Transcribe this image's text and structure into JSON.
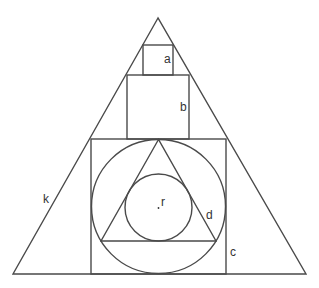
{
  "diagram": {
    "labels": {
      "a": "a",
      "b": "b",
      "c": "c",
      "d": "d",
      "k": "k",
      "r": "r"
    },
    "colors": {
      "line": "#4a4a4a",
      "text": "#333333",
      "background": "#ffffff"
    }
  }
}
